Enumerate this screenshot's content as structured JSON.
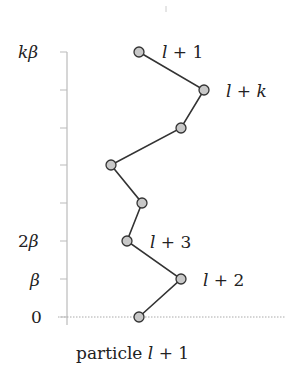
{
  "diagram": {
    "y_axis": {
      "tick_labels": [
        {
          "text": "kβ",
          "y": 52
        },
        {
          "text": "2β",
          "y": 241
        },
        {
          "text": "β",
          "y": 279
        },
        {
          "text": "0",
          "y": 317
        }
      ],
      "tick_ys": [
        52,
        90,
        128,
        165,
        203,
        241,
        279,
        317
      ]
    },
    "points": [
      {
        "x": 139,
        "y": 52
      },
      {
        "x": 204,
        "y": 90
      },
      {
        "x": 181,
        "y": 128
      },
      {
        "x": 111,
        "y": 165
      },
      {
        "x": 142,
        "y": 203
      },
      {
        "x": 127,
        "y": 241
      },
      {
        "x": 181,
        "y": 279
      },
      {
        "x": 139,
        "y": 317
      }
    ],
    "point_labels": [
      {
        "text": "l + 1",
        "x": 162,
        "y": 59
      },
      {
        "text": "l + k",
        "x": 226,
        "y": 97
      },
      {
        "text": "l + 3",
        "x": 150,
        "y": 248
      },
      {
        "text": "l + 2",
        "x": 203,
        "y": 286
      }
    ],
    "x_caption": "particle l + 1",
    "colors": {
      "marker_fill": "#c8c8c8",
      "line": "#333333",
      "axis": "#bbbbbb"
    }
  }
}
